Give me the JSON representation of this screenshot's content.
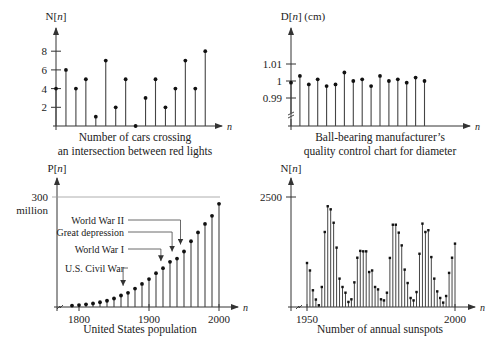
{
  "figure": {
    "captions": {
      "cars": [
        "Number of cars crossing",
        "an intersection between red lights"
      ],
      "bearing": [
        "Ball-bearing manufacturer’s",
        "quality control chart for diameter"
      ],
      "population": [
        "United States population"
      ],
      "sunspots": [
        "Number of annual sunspots"
      ]
    }
  },
  "chart_data": [
    {
      "id": "cars",
      "type": "stem",
      "title": "Number of cars crossing an intersection between red lights",
      "ylabel": "N[n]",
      "xlabel": "n",
      "yticks": [
        2,
        4,
        6,
        8
      ],
      "ylim": [
        0,
        9
      ],
      "x": [
        0,
        1,
        2,
        3,
        4,
        5,
        6,
        7,
        8,
        9,
        10,
        11,
        12,
        13,
        14,
        15
      ],
      "values": [
        4,
        6,
        4,
        5,
        1,
        7,
        2,
        5,
        0,
        3,
        5,
        2,
        4,
        7,
        4,
        8
      ]
    },
    {
      "id": "bearing",
      "type": "stem",
      "title": "Ball-bearing manufacturer’s quality control chart for diameter",
      "ylabel": "D[n] (cm)",
      "xlabel": "n",
      "yticks": [
        0.99,
        1,
        1.01
      ],
      "ytick_labels": [
        "0.99",
        "1",
        "1.01"
      ],
      "axis_break": true,
      "x": [
        0,
        1,
        2,
        3,
        4,
        5,
        6,
        7,
        8,
        9,
        10,
        11,
        12,
        13,
        14,
        15
      ],
      "values": [
        0.999,
        1.003,
        0.998,
        1.001,
        0.997,
        0.998,
        1.005,
        1.0,
        1.001,
        0.997,
        1.003,
        1.0,
        1.001,
        0.999,
        1.002,
        1.0
      ]
    },
    {
      "id": "population",
      "type": "stem",
      "title": "United States population",
      "ylabel": "P[n]",
      "xlabel": "n",
      "yticks": [
        300
      ],
      "ytick_labels": [
        "300",
        "million"
      ],
      "xticks": [
        1800,
        1900,
        2000
      ],
      "gridline_at": 300,
      "axis_break": true,
      "x": [
        1790,
        1800,
        1810,
        1820,
        1830,
        1840,
        1850,
        1860,
        1870,
        1880,
        1890,
        1900,
        1910,
        1920,
        1930,
        1940,
        1950,
        1960,
        1970,
        1980,
        1990,
        2000
      ],
      "values": [
        3.9,
        5.3,
        7.2,
        9.6,
        12.9,
        17.1,
        23.2,
        31.4,
        38.6,
        50.2,
        62.9,
        76.2,
        92.2,
        106.0,
        123.2,
        132.2,
        151.3,
        179.3,
        203.3,
        226.5,
        248.7,
        281.4
      ],
      "annotations": [
        {
          "label": "World War II",
          "x": 1945
        },
        {
          "label": "Great depression",
          "x": 1933
        },
        {
          "label": "World War I",
          "x": 1917
        },
        {
          "label": "U.S. Civil War",
          "x": 1863
        }
      ]
    },
    {
      "id": "sunspots",
      "type": "stem",
      "title": "Number of annual sunspots",
      "ylabel": "N[n]",
      "xlabel": "n",
      "yticks": [
        2500
      ],
      "xticks": [
        1950,
        2000
      ],
      "axis_break": true,
      "x": [
        1950,
        1951,
        1952,
        1953,
        1954,
        1955,
        1956,
        1957,
        1958,
        1959,
        1960,
        1961,
        1962,
        1963,
        1964,
        1965,
        1966,
        1967,
        1968,
        1969,
        1970,
        1971,
        1972,
        1973,
        1974,
        1975,
        1976,
        1977,
        1978,
        1979,
        1980,
        1981,
        1982,
        1983,
        1984,
        1985,
        1986,
        1987,
        1988,
        1989,
        1990,
        1991,
        1992,
        1993,
        1994,
        1995,
        1996,
        1997,
        1998,
        1999,
        2000
      ],
      "values": [
        1000,
        830,
        380,
        170,
        40,
        455,
        1705,
        2290,
        2220,
        1915,
        1350,
        645,
        455,
        325,
        115,
        175,
        560,
        1120,
        1275,
        1265,
        1265,
        795,
        830,
        455,
        400,
        175,
        150,
        325,
        1115,
        1870,
        1870,
        1690,
        1400,
        850,
        545,
        205,
        150,
        340,
        1210,
        1895,
        1705,
        1745,
        1135,
        645,
        355,
        205,
        100,
        250,
        775,
        1120,
        1440
      ]
    }
  ]
}
